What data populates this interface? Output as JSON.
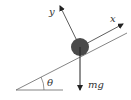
{
  "diagram": {
    "labels": {
      "y_axis": "y",
      "x_axis": "x",
      "angle": "θ",
      "weight": "mg"
    },
    "colors": {
      "line": "#555555",
      "ball": "#4a4a4a",
      "arrow": "#222222",
      "background": "#ffffff"
    }
  }
}
